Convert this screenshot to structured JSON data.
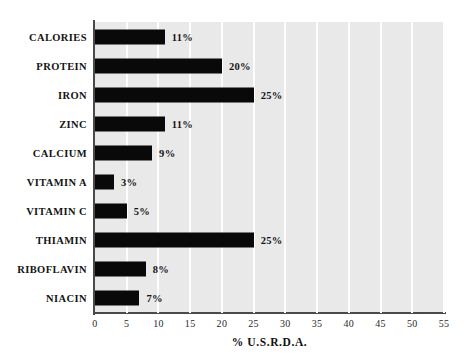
{
  "chart_data": {
    "type": "bar",
    "orientation": "horizontal",
    "title": "",
    "xlabel": "% U.S.R.D.A.",
    "ylabel": "",
    "xlim": [
      0,
      55
    ],
    "xticks": [
      0,
      5,
      10,
      15,
      20,
      25,
      30,
      35,
      40,
      45,
      50,
      55
    ],
    "xtick_labels": [
      "0",
      "5",
      "10",
      "15",
      "20",
      "25",
      "30",
      "35",
      "40",
      "45",
      "50",
      "55"
    ],
    "grid": true,
    "grid_axis": "x",
    "legend": false,
    "categories": [
      "CALORIES",
      "PROTEIN",
      "IRON",
      "ZINC",
      "CALCIUM",
      "VITAMIN A",
      "VITAMIN C",
      "THIAMIN",
      "RIBOFLAVIN",
      "NIACIN"
    ],
    "values": [
      11,
      20,
      25,
      11,
      9,
      3,
      5,
      25,
      8,
      7
    ],
    "value_labels": [
      "11%",
      "20%",
      "25%",
      "11%",
      "9%",
      "3%",
      "5%",
      "25%",
      "8%",
      "7%"
    ],
    "bar_color": "#090909",
    "plot_background": "#e9e9e9",
    "gridline_color": "#fdfdfd",
    "axis_color": "#4a4a4a"
  },
  "axis": {
    "x_title": "% U.S.R.D.A."
  }
}
